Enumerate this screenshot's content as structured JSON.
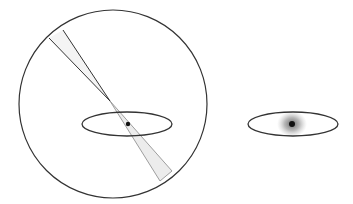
{
  "diagram": {
    "background": "#ffffff",
    "stroke_color": "#333333",
    "wedge_fill": "#ececec",
    "blur_color": "#555555",
    "core_color": "#111111",
    "left_panel": {
      "circle": {
        "cx": 113,
        "cy": 104,
        "r": 94
      },
      "ellipse": {
        "cx": 127,
        "cy": 124,
        "rx": 45,
        "ry": 12
      },
      "blur": {
        "cx": 127,
        "cy": 124,
        "rx": 16,
        "ry": 14
      },
      "core": {
        "cx": 128,
        "cy": 124,
        "r": 2.2
      },
      "beam": {
        "upper_start_a": [
          49,
          38
        ],
        "upper_start_b": [
          63,
          30
        ],
        "focus": [
          110,
          101
        ],
        "lower_end_a": [
          160,
          181
        ],
        "lower_end_b": [
          172,
          171
        ]
      }
    },
    "right_panel": {
      "ellipse": {
        "cx": 293,
        "cy": 124,
        "rx": 45,
        "ry": 12
      },
      "blur": {
        "cx": 292,
        "cy": 124,
        "rx": 15,
        "ry": 13
      },
      "core": {
        "cx": 292,
        "cy": 124,
        "r": 3
      }
    }
  }
}
